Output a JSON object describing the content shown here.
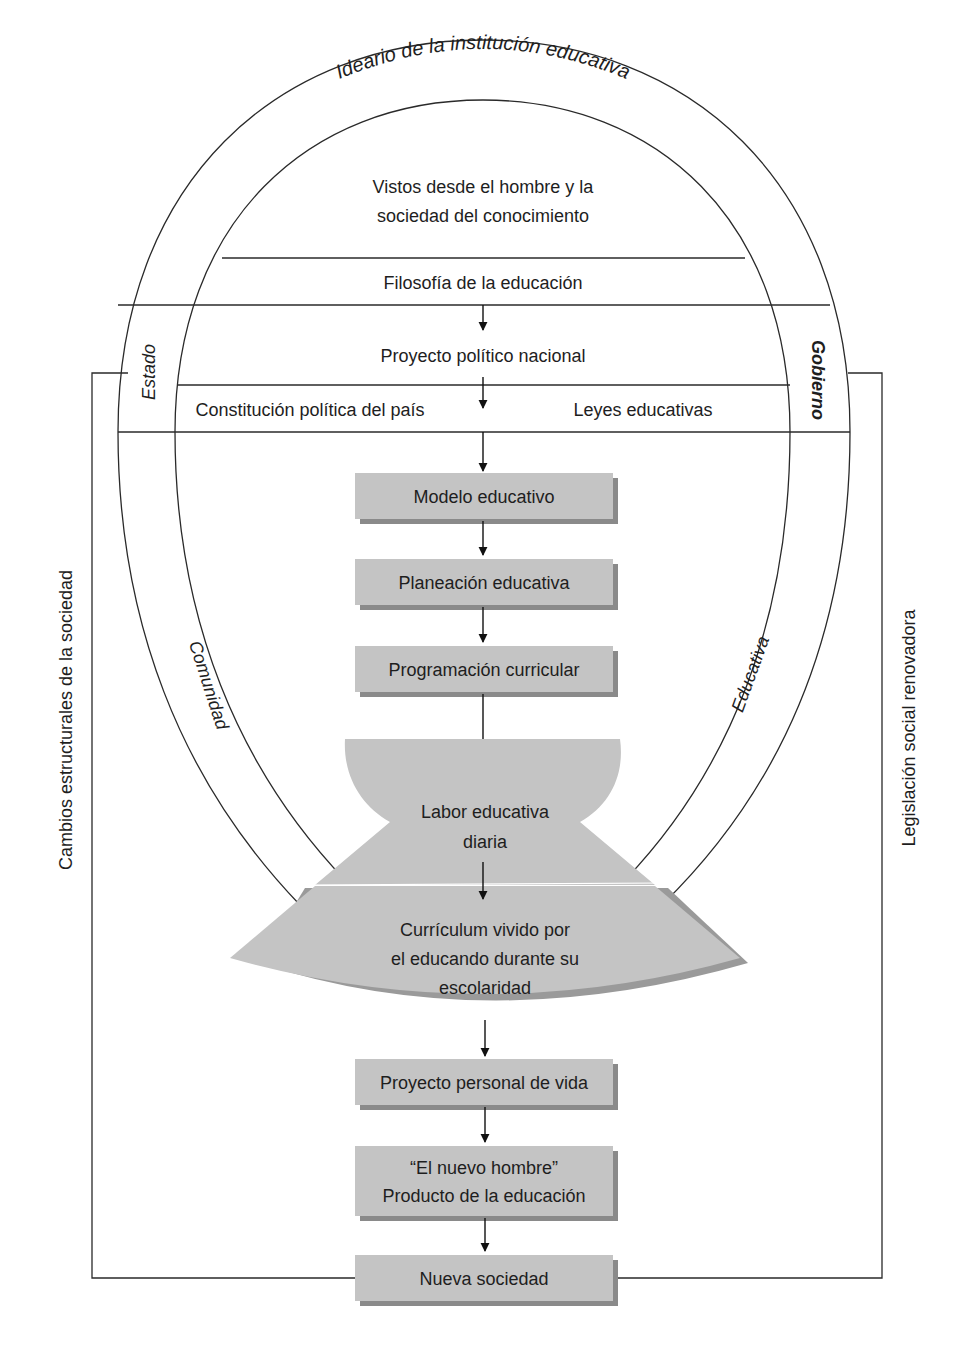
{
  "diagram": {
    "arc_title": "Ideario de la institución educativa",
    "top_section": {
      "line1": "Vistos desde el hombre y la",
      "line2": "sociedad del conocimiento"
    },
    "philosophy": "Filosofía de la educación",
    "national_project": "Proyecto político nacional",
    "constitution": "Constitución política del país",
    "laws": "Leyes educativas",
    "arc_labels": {
      "estado": "Estado",
      "gobierno": "Gobierno",
      "comunidad": "Comunidad",
      "educativa": "Educativa"
    },
    "side_labels": {
      "left": "Cambios estructurales de la sociedad",
      "right": "Legislación social renovadora"
    },
    "flow_boxes": [
      "Modelo educativo",
      "Planeación educativa",
      "Programación curricular"
    ],
    "hourglass": {
      "upper": {
        "line1": "Labor educativa",
        "line2": "diaria"
      },
      "lower": {
        "line1": "Currículum vivido por",
        "line2": "el educando durante su",
        "line3": "escolaridad"
      }
    },
    "bottom_boxes": {
      "personal_project": "Proyecto personal de vida",
      "new_man": {
        "line1": "“El nuevo hombre”",
        "line2": "Producto de la educación"
      },
      "new_society": "Nueva sociedad"
    },
    "colors": {
      "box_fill": "#c4c4c4",
      "box_shadow": "#8a8a8a",
      "line": "#2a2a2a",
      "background": "#ffffff"
    }
  }
}
